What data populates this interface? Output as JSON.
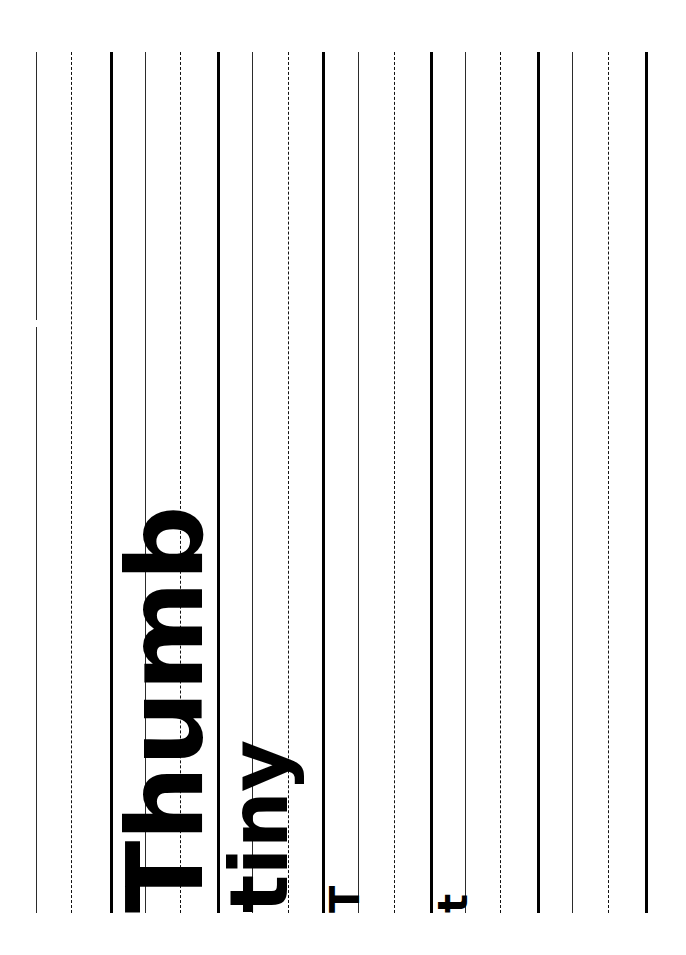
{
  "page": {
    "orientation": "rotated-90-ccw",
    "background_color": "#ffffff",
    "ink_color": "#000000",
    "width_px": 686,
    "height_px": 955
  },
  "specimens": [
    {
      "name": "thumb",
      "text": "Thumb",
      "size_label": "106"
    },
    {
      "name": "tiny",
      "text": "tiny",
      "size_label": "80"
    },
    {
      "name": "t-cap",
      "text": "T",
      "size_label": "40"
    },
    {
      "name": "t-low",
      "text": "t",
      "size_label": "40"
    },
    {
      "name": "blank1",
      "text": "",
      "size_label": "18"
    },
    {
      "name": "blank2",
      "text": "",
      "size_label": "14"
    }
  ],
  "rules": {
    "top_px": 52,
    "bottom_px": 913,
    "groups": [
      {
        "name": "group-1",
        "ascender_line_x": 36,
        "midline_x": 71,
        "baseline_x": 110,
        "ascender_style": "thin-broken",
        "midline_style": "dashed",
        "baseline_style": "thick"
      },
      {
        "name": "group-2",
        "ascender_line_x": 145,
        "midline_x": 180,
        "baseline_x": 217,
        "ascender_style": "thin",
        "midline_style": "dashed",
        "baseline_style": "thick"
      },
      {
        "name": "group-3",
        "ascender_line_x": 252,
        "midline_x": 288,
        "baseline_x": 322,
        "ascender_style": "thin",
        "midline_style": "dashed",
        "baseline_style": "thick"
      },
      {
        "name": "group-4",
        "ascender_line_x": 358,
        "midline_x": 394,
        "baseline_x": 430,
        "ascender_style": "thin",
        "midline_style": "dashed",
        "baseline_style": "thick"
      },
      {
        "name": "group-5",
        "ascender_line_x": 465,
        "midline_x": 500,
        "baseline_x": 537,
        "ascender_style": "thin",
        "midline_style": "dashed",
        "baseline_style": "thick"
      },
      {
        "name": "group-6",
        "ascender_line_x": 572,
        "midline_x": 608,
        "baseline_x": 645,
        "ascender_style": "thin",
        "midline_style": "dashed",
        "baseline_style": "thick"
      }
    ]
  }
}
